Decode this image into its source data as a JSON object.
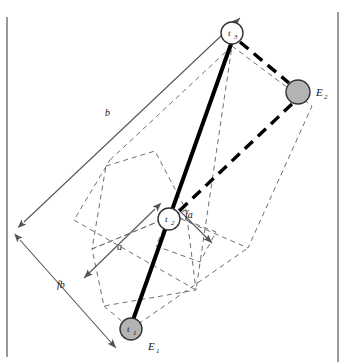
{
  "figure": {
    "background_color": "#ffffff",
    "border_color": "#9a9a9a",
    "nodes": [
      {
        "id": "t1",
        "label": "t",
        "subscript": "1",
        "style": "filled-gray",
        "fill": "#b3b3b3",
        "stroke": "#333333",
        "x": 131,
        "y": 329,
        "r": 11
      },
      {
        "id": "t2",
        "label": "t",
        "subscript": "2",
        "style": "open-white",
        "fill": "#ffffff",
        "stroke": "#333333",
        "x": 169,
        "y": 219,
        "r": 11
      },
      {
        "id": "t3",
        "label": "t",
        "subscript": "3",
        "style": "open-white",
        "fill": "#ffffff",
        "stroke": "#333333",
        "x": 232,
        "y": 33,
        "r": 11
      },
      {
        "id": "E2node",
        "label": "",
        "subscript": "",
        "style": "filled-gray",
        "fill": "#b3b3b3",
        "stroke": "#333333",
        "x": 298,
        "y": 92,
        "r": 12
      }
    ],
    "point_labels": [
      {
        "id": "E1",
        "label": "E",
        "subscript": "1",
        "x": 152,
        "y": 347
      },
      {
        "id": "E2",
        "label": "E",
        "subscript": "2",
        "x": 318,
        "y": 92
      }
    ],
    "dimension_labels": [
      {
        "id": "b",
        "text": "b",
        "x": 108,
        "y": 113
      },
      {
        "id": "a",
        "text": "a",
        "x": 120,
        "y": 247
      },
      {
        "id": "fa",
        "text": "fa",
        "x": 190,
        "y": 215
      },
      {
        "id": "fb",
        "text": "fb",
        "x": 62,
        "y": 285
      }
    ],
    "solid_line": {
      "description": "thick solid spine through t1, t2, t3",
      "color": "#000000",
      "width": 4
    },
    "dashed_line": {
      "description": "thick dashed path t3 to E2 to lower right of t2",
      "color": "#000000",
      "width": 3.4
    },
    "thin_dashed_color": "#6f6f6f",
    "arrow_color": "#555555"
  }
}
